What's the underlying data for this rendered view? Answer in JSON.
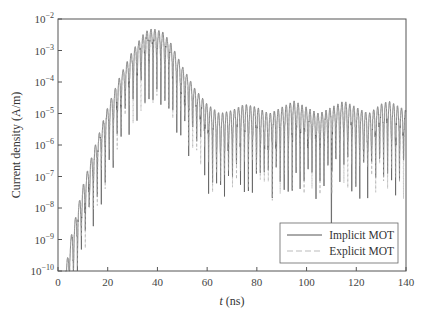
{
  "chart_data": {
    "type": "line",
    "title": "",
    "xlabel_italic": "t",
    "xlabel_rest": " (ns)",
    "ylabel": "Current density (A/m)",
    "xlim": [
      0,
      140
    ],
    "ylim": [
      1e-10,
      0.01
    ],
    "yscale": "log",
    "grid": false,
    "xticks": [
      0,
      20,
      40,
      60,
      80,
      100,
      120,
      140
    ],
    "xtick_labels": [
      "0",
      "20",
      "40",
      "60",
      "80",
      "100",
      "120",
      "140"
    ],
    "yticks_exp": [
      -2,
      -3,
      -4,
      -5,
      -6,
      -7,
      -8,
      -9,
      -10
    ],
    "ytick_base": "10",
    "legend_position": "bottom-right",
    "oscillation_period_ns": 1.6,
    "series": [
      {
        "name": "Implicit MOT",
        "style": "solid",
        "color": "#555555",
        "envelope_t": [
          3,
          5,
          10,
          15,
          20,
          25,
          30,
          35,
          38,
          42,
          45,
          50,
          55,
          60,
          65,
          70,
          75,
          80,
          85,
          90,
          95,
          100,
          105,
          110,
          115,
          120,
          125,
          130,
          133,
          140
        ],
        "envelope_log10": [
          -10,
          -9,
          -7.3,
          -6,
          -4.8,
          -3.8,
          -3,
          -2.4,
          -2.3,
          -2.4,
          -2.7,
          -3.5,
          -4.2,
          -4.7,
          -5.0,
          -4.9,
          -4.7,
          -4.8,
          -5.0,
          -4.8,
          -4.6,
          -4.8,
          -5.0,
          -4.8,
          -4.6,
          -4.8,
          -5.0,
          -4.7,
          -4.6,
          -4.9
        ]
      },
      {
        "name": "Explicit MOT",
        "style": "dashed",
        "color": "#aaaaaa",
        "envelope_t": [
          3,
          5,
          10,
          15,
          20,
          25,
          30,
          35,
          38,
          42,
          45,
          50,
          55,
          60,
          65,
          70,
          75,
          80,
          85,
          90,
          95,
          100,
          105,
          110,
          115,
          120,
          125,
          130,
          133,
          140
        ],
        "envelope_log10": [
          -10,
          -9,
          -7.3,
          -6,
          -4.8,
          -3.8,
          -3,
          -2.4,
          -2.3,
          -2.4,
          -2.7,
          -3.5,
          -4.2,
          -4.7,
          -5.0,
          -4.9,
          -4.7,
          -4.8,
          -5.0,
          -4.8,
          -4.6,
          -4.8,
          -5.0,
          -4.8,
          -4.6,
          -4.8,
          -5.0,
          -4.7,
          -4.6,
          -4.9
        ]
      }
    ],
    "annotations": [
      {
        "t": 110,
        "note": "isolated deep dip to ~1e-9 in Implicit MOT"
      }
    ]
  }
}
